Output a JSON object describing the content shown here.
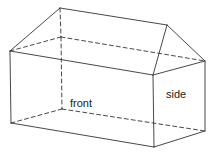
{
  "diagram": {
    "type": "3d-wireframe-prism",
    "line_color": "#333333",
    "background": "#ffffff",
    "vertices": {
      "A": [
        60,
        8
      ],
      "B": [
        167,
        25
      ],
      "C": [
        10,
        51
      ],
      "D": [
        153,
        75
      ],
      "E": [
        205,
        61
      ],
      "F": [
        61,
        37
      ],
      "G": [
        11,
        123
      ],
      "H": [
        154,
        147
      ],
      "I": [
        205,
        131
      ],
      "J": [
        62,
        109
      ]
    },
    "solid_edges": [
      [
        "A",
        "B"
      ],
      [
        "A",
        "C"
      ],
      [
        "C",
        "D"
      ],
      [
        "B",
        "D"
      ],
      [
        "B",
        "E"
      ],
      [
        "D",
        "E"
      ],
      [
        "C",
        "G"
      ],
      [
        "G",
        "H"
      ],
      [
        "D",
        "H"
      ],
      [
        "H",
        "I"
      ],
      [
        "E",
        "I"
      ]
    ],
    "hidden_edges": [
      [
        "A",
        "F"
      ],
      [
        "F",
        "J"
      ],
      [
        "C",
        "F"
      ],
      [
        "F",
        "E"
      ],
      [
        "G",
        "J"
      ],
      [
        "J",
        "I"
      ]
    ],
    "labels": {
      "front": "front",
      "side": "side"
    }
  }
}
